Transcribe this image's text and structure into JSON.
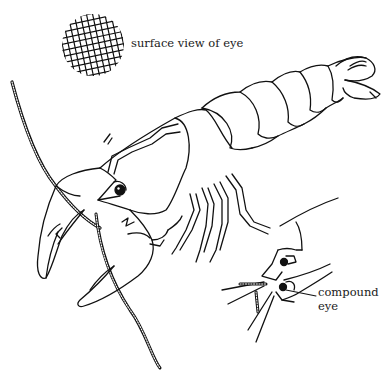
{
  "diagram": {
    "style": "black line drawing on white",
    "colors": {
      "background": "#ffffff",
      "ink": "#111111"
    },
    "labels": {
      "surface_view": "surface view of eye",
      "compound_eye_line1": "compound",
      "compound_eye_line2": "eye"
    },
    "parts": [
      "surface-view-of-eye (cross-hatched circle)",
      "crayfish body (cephalothorax, abdomen, tail fan)",
      "claws (chelae)",
      "walking legs",
      "long antenna",
      "eye on stalk",
      "close-up head with compound eye"
    ]
  }
}
